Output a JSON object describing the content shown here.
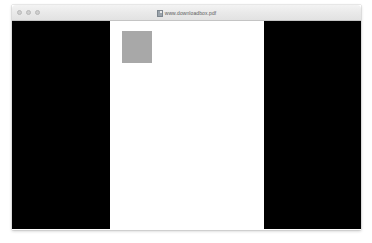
{
  "window": {
    "titlebar": {
      "title": "www.downloadbox.pdf",
      "document_icon": "document-icon",
      "traffic_lights": [
        {
          "name": "close",
          "label": "Close",
          "color": "#cfcfcf"
        },
        {
          "name": "minimize",
          "label": "Minimize",
          "color": "#cfcfcf"
        },
        {
          "name": "zoom",
          "label": "Zoom",
          "color": "#cfcfcf"
        }
      ]
    },
    "content": {
      "background_color": "#ffffff",
      "shapes": [
        {
          "name": "left-black-panel",
          "color": "#000000"
        },
        {
          "name": "right-black-panel",
          "color": "#000000"
        },
        {
          "name": "gray-square",
          "color": "#a8a8a8"
        }
      ]
    }
  },
  "desktop": {
    "background_color": "#ffffff"
  }
}
